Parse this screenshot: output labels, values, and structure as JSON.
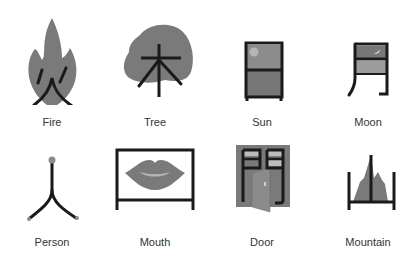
{
  "colors": {
    "fill": "#7a7a7a",
    "light_fill": "#a8a8a8",
    "stroke": "#1a1a1a",
    "label": "#333333"
  },
  "items": [
    {
      "label": "Fire",
      "character": "火",
      "icon": "fire-icon"
    },
    {
      "label": "Tree",
      "character": "木",
      "icon": "tree-icon"
    },
    {
      "label": "Sun",
      "character": "日",
      "icon": "sun-icon"
    },
    {
      "label": "Moon",
      "character": "月",
      "icon": "moon-icon"
    },
    {
      "label": "Person",
      "character": "人",
      "icon": "person-icon"
    },
    {
      "label": "Mouth",
      "character": "口",
      "icon": "mouth-icon"
    },
    {
      "label": "Door",
      "character": "門",
      "icon": "door-icon"
    },
    {
      "label": "Mountain",
      "character": "山",
      "icon": "mountain-icon"
    }
  ]
}
